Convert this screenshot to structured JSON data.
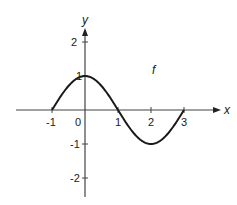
{
  "chart_data": {
    "type": "line",
    "title": "",
    "xlabel": "x",
    "ylabel": "y",
    "function_label": "f",
    "xlim": [
      -2.0,
      4.1
    ],
    "ylim": [
      -2.6,
      2.5
    ],
    "x_ticks": [
      -1,
      0,
      1,
      2,
      3
    ],
    "y_ticks": [
      -2,
      -1,
      1,
      2
    ],
    "x_tick_labels": [
      "-1",
      "0",
      "1",
      "2",
      "3"
    ],
    "y_tick_labels": [
      "-2",
      "-1",
      "1",
      "2"
    ],
    "grid": false,
    "legend": null,
    "series": [
      {
        "name": "f",
        "description": "smooth curve, f(x) = cos(pi*x/2) on [-1, 3]",
        "x": [
          -1,
          -0.5,
          0,
          0.5,
          1,
          1.5,
          2,
          2.5,
          3
        ],
        "y": [
          0,
          0.707,
          1,
          0.707,
          0,
          -0.707,
          -1,
          -0.707,
          0
        ]
      }
    ],
    "key_points": [
      {
        "x": -1,
        "y": 0
      },
      {
        "x": 0,
        "y": 1
      },
      {
        "x": 1,
        "y": 0
      },
      {
        "x": 2,
        "y": -1
      },
      {
        "x": 3,
        "y": 0
      }
    ],
    "colors": {
      "curve": "#1a1a1a",
      "axes": "#444444"
    }
  }
}
